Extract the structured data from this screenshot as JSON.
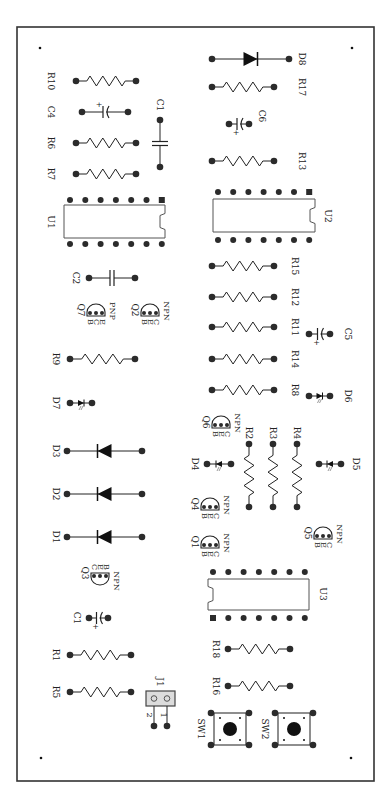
{
  "board": {
    "title": "PCB component layout",
    "border": {
      "x": 17,
      "y": 27,
      "w": 357,
      "h": 754
    },
    "mounting_holes": [
      [
        40,
        48
      ],
      [
        352,
        48
      ],
      [
        41,
        758
      ],
      [
        351,
        758
      ]
    ],
    "colors": {
      "ink": "#222222",
      "pad": "#2b2b2b",
      "header_fill": "#dcdcdc"
    }
  },
  "resistors_h": [
    {
      "ref": "R10",
      "x1": 76,
      "x2": 136,
      "y": 81,
      "lx": 51,
      "ly": 81
    },
    {
      "ref": "R6",
      "x1": 76,
      "x2": 136,
      "y": 143,
      "lx": 51,
      "ly": 143
    },
    {
      "ref": "R7",
      "x1": 76,
      "x2": 136,
      "y": 174,
      "lx": 51,
      "ly": 174
    },
    {
      "ref": "R9",
      "x1": 70,
      "x2": 135,
      "y": 359,
      "lx": 56,
      "ly": 359
    },
    {
      "ref": "R1",
      "x1": 70,
      "x2": 131,
      "y": 655,
      "lx": 56,
      "ly": 655
    },
    {
      "ref": "R5",
      "x1": 70,
      "x2": 131,
      "y": 692,
      "lx": 56,
      "ly": 692
    },
    {
      "ref": "R17",
      "x1": 212,
      "x2": 274,
      "y": 87,
      "lx": 302,
      "ly": 87
    },
    {
      "ref": "R13",
      "x1": 212,
      "x2": 274,
      "y": 161,
      "lx": 302,
      "ly": 161
    },
    {
      "ref": "R15",
      "x1": 212,
      "x2": 274,
      "y": 266,
      "lx": 295,
      "ly": 266
    },
    {
      "ref": "R12",
      "x1": 212,
      "x2": 274,
      "y": 297,
      "lx": 295,
      "ly": 297
    },
    {
      "ref": "R11",
      "x1": 212,
      "x2": 274,
      "y": 327,
      "lx": 295,
      "ly": 327
    },
    {
      "ref": "R14",
      "x1": 212,
      "x2": 274,
      "y": 359,
      "lx": 295,
      "ly": 359
    },
    {
      "ref": "R8",
      "x1": 212,
      "x2": 274,
      "y": 390,
      "lx": 295,
      "ly": 390
    },
    {
      "ref": "R18",
      "x1": 228,
      "x2": 290,
      "y": 649,
      "lx": 216,
      "ly": 649
    },
    {
      "ref": "R16",
      "x1": 228,
      "x2": 290,
      "y": 686,
      "lx": 216,
      "ly": 686
    }
  ],
  "resistors_v": [
    {
      "ref": "R2",
      "x": 249,
      "y1": 444,
      "y2": 507,
      "lx": 249,
      "ly": 433
    },
    {
      "ref": "R3",
      "x": 273,
      "y1": 444,
      "y2": 507,
      "lx": 273,
      "ly": 433
    },
    {
      "ref": "R4",
      "x": 297,
      "y1": 444,
      "y2": 507,
      "lx": 297,
      "ly": 433
    }
  ],
  "diodes": [
    {
      "ref": "D8",
      "x1": 212,
      "x2": 289,
      "y": 59,
      "lx": 302,
      "ly": 59
    },
    {
      "ref": "D3",
      "x1": 67,
      "x2": 142,
      "y": 451,
      "lx": 56,
      "ly": 451
    },
    {
      "ref": "D2",
      "x1": 67,
      "x2": 142,
      "y": 494,
      "lx": 56,
      "ly": 494
    },
    {
      "ref": "D1",
      "x1": 67,
      "x2": 142,
      "y": 537,
      "lx": 56,
      "ly": 537
    }
  ],
  "leds": [
    {
      "ref": "D7",
      "x1": 70,
      "x2": 92,
      "y": 403,
      "lx": 56,
      "ly": 403
    },
    {
      "ref": "D6",
      "x1": 309,
      "x2": 330,
      "y": 396,
      "lx": 348,
      "ly": 396
    },
    {
      "ref": "D4",
      "x1": 207,
      "x2": 231,
      "y": 464,
      "lx": 195,
      "ly": 464,
      "flip": true
    },
    {
      "ref": "D5",
      "x1": 319,
      "x2": 341,
      "y": 464,
      "lx": 356,
      "ly": 464,
      "flip": true
    }
  ],
  "caps_film": [
    {
      "ref": "C1",
      "orient": "v",
      "x": 160,
      "y1": 120,
      "y2": 167,
      "lx": 160,
      "ly": 105
    },
    {
      "ref": "C2",
      "orient": "h",
      "x1": 89,
      "x2": 135,
      "y": 278,
      "lx": 76,
      "ly": 278
    }
  ],
  "caps_elec": [
    {
      "ref": "C4",
      "x1": 82,
      "x2": 128,
      "y": 112,
      "lx": 51,
      "ly": 112,
      "plus": "left"
    },
    {
      "ref": "C6",
      "x1": 229,
      "x2": 249,
      "y": 124,
      "lx": 262,
      "ly": 116,
      "plus": "below"
    },
    {
      "ref": "C5",
      "x1": 309,
      "x2": 330,
      "y": 334,
      "lx": 348,
      "ly": 334,
      "plus": "below"
    },
    {
      "ref": "C1",
      "x1": 89,
      "x2": 108,
      "y": 618,
      "lx": 77,
      "ly": 618,
      "plus": "below"
    }
  ],
  "transistors": [
    {
      "ref": "Q7",
      "cx": 96,
      "cy": 313,
      "pins": "BCE",
      "type": "PNP",
      "dir": "up"
    },
    {
      "ref": "Q2",
      "cx": 150,
      "cy": 313,
      "pins": "BEC",
      "type": "NPN",
      "dir": "up"
    },
    {
      "ref": "Q6",
      "cx": 221,
      "cy": 425,
      "pins": "BEC",
      "type": "NPN",
      "dir": "up"
    },
    {
      "ref": "Q4",
      "cx": 210,
      "cy": 507,
      "pins": "BEC",
      "type": "NPN",
      "dir": "up"
    },
    {
      "ref": "Q1",
      "cx": 210,
      "cy": 545,
      "pins": "BEC",
      "type": "NPN",
      "dir": "up"
    },
    {
      "ref": "Q5",
      "cx": 323,
      "cy": 536,
      "pins": "BEC",
      "type": "NPN",
      "dir": "up"
    },
    {
      "ref": "Q3",
      "cx": 100,
      "cy": 576,
      "pins": "CEB",
      "type": "NPN",
      "dir": "down"
    }
  ],
  "ics": [
    {
      "ref": "U1",
      "x": 64,
      "y": 205,
      "w": 101,
      "h": 33,
      "pins_top": 200,
      "pins_bottom": 244,
      "pin_x0": 70,
      "pin_dx": 15.3,
      "pin1": "top-right",
      "notch": "right",
      "lx": 51,
      "ly": 222
    },
    {
      "ref": "U2",
      "x": 213,
      "y": 199,
      "w": 102,
      "h": 33,
      "pins_top": 192,
      "pins_bottom": 240,
      "pin_x0": 218,
      "pin_dx": 15.2,
      "pin1": "top-right",
      "notch": "right",
      "lx": 328,
      "ly": 216
    },
    {
      "ref": "U3",
      "x": 208,
      "y": 579,
      "w": 101,
      "h": 31,
      "pins_top": 572,
      "pins_bottom": 618,
      "pin_x0": 213,
      "pin_dx": 15.3,
      "pin1": "bottom-left",
      "notch": "left",
      "lx": 323,
      "ly": 594
    }
  ],
  "header": {
    "ref": "J1",
    "x": 146,
    "y": 691,
    "w": 29,
    "h": 15,
    "pin_labels": [
      "2",
      "1"
    ],
    "lx": 160,
    "ly": 682
  },
  "switches": [
    {
      "ref": "SW1",
      "x": 214,
      "y": 713,
      "size": 32,
      "lx": 201,
      "ly": 729
    },
    {
      "ref": "SW2",
      "x": 278,
      "y": 713,
      "size": 32,
      "lx": 265,
      "ly": 729
    }
  ]
}
